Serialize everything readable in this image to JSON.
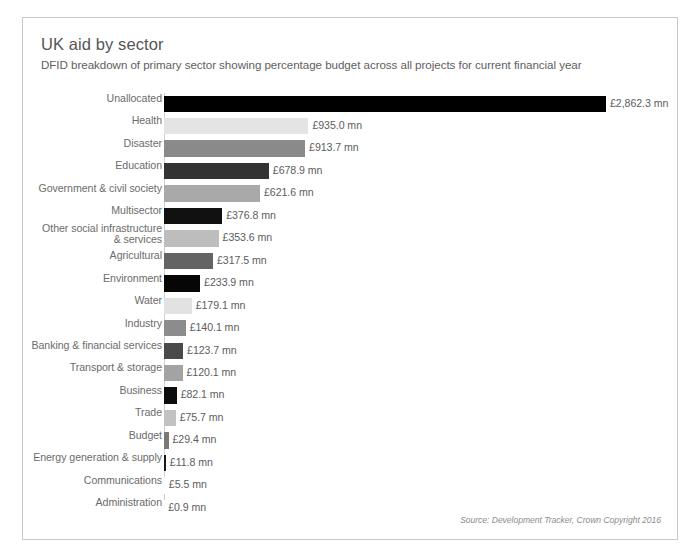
{
  "chart_data": {
    "type": "bar",
    "orientation": "horizontal",
    "title": "UK aid by sector",
    "subtitle": "DFID breakdown of primary sector showing percentage budget across all projects for current financial year",
    "xlabel": "",
    "ylabel": "",
    "unit": "£ mn",
    "grid": false,
    "legend": false,
    "xlim": [
      0,
      2862.3
    ],
    "categories": [
      "Unallocated",
      "Health",
      "Disaster",
      "Education",
      "Government & civil society",
      "Multisector",
      "Other social infrastructure\n& services",
      "Agricultural",
      "Environment",
      "Water",
      "Industry",
      "Banking & financial services",
      "Transport & storage",
      "Business",
      "Trade",
      "Budget",
      "Energy generation & supply",
      "Communications",
      "Administration"
    ],
    "values": [
      2862.3,
      935.0,
      913.7,
      678.9,
      621.6,
      376.8,
      353.6,
      317.5,
      233.9,
      179.1,
      140.1,
      123.7,
      120.1,
      82.1,
      75.7,
      29.4,
      11.8,
      5.5,
      0.9
    ],
    "value_labels": [
      "£2,862.3 mn",
      "£935.0 mn",
      "£913.7 mn",
      "£678.9 mn",
      "£621.6 mn",
      "£376.8 mn",
      "£353.6 mn",
      "£317.5 mn",
      "£233.9 mn",
      "£179.1 mn",
      "£140.1 mn",
      "£123.7 mn",
      "£120.1 mn",
      "£82.1 mn",
      "£75.7 mn",
      "£29.4 mn",
      "£11.8 mn",
      "£5.5 mn",
      "£0.9 mn"
    ],
    "bar_colors": [
      "#000000",
      "#e4e4e4",
      "#8a8a8a",
      "#333333",
      "#a9a9a9",
      "#111111",
      "#bdbdbd",
      "#646464",
      "#060606",
      "#e2e2e2",
      "#8c8c8c",
      "#4a4a4a",
      "#a3a3a3",
      "#0d0d0d",
      "#c2c2c2",
      "#787878",
      "#1a1a1a",
      "#ffffff",
      "#ffffff"
    ]
  },
  "footer": {
    "source": "Source: Development Tracker, Crown Copyright 2016"
  }
}
